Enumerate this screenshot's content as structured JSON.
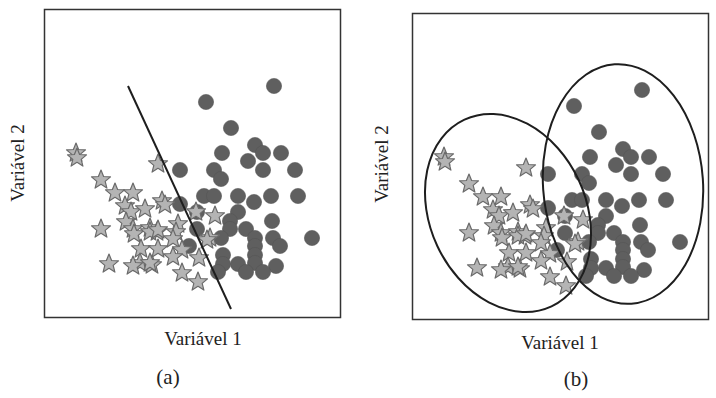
{
  "panels": [
    {
      "id": "a",
      "label": "(a)",
      "xlabel": "Variável 1",
      "ylabel": "Variável 2",
      "boundary": "linear-separator",
      "line": {
        "x1": 128,
        "y1": 86,
        "x2": 231,
        "y2": 309
      }
    },
    {
      "id": "b",
      "label": "(b)",
      "xlabel": "Variável 1",
      "ylabel": "Variável 2",
      "boundary": "ellipses",
      "ellipses": [
        {
          "cx": 508,
          "cy": 213,
          "rx": 78,
          "ry": 103,
          "rot": -25
        },
        {
          "cx": 623,
          "cy": 184,
          "rx": 80,
          "ry": 121,
          "rot": -4
        }
      ]
    }
  ],
  "colors": {
    "star_fill": "#b4b4b4",
    "star_stroke": "#6a6a6a",
    "circle_fill": "#5f5f5f",
    "line": "#1e1e1e",
    "frame": "#333333"
  },
  "chart_data": {
    "type": "scatter",
    "title": "",
    "xlabel": "Variável 1",
    "ylabel": "Variável 2",
    "series": [
      {
        "name": "stars",
        "marker": "star",
        "points_panel_a": [
          [
            76,
            153
          ],
          [
            77,
            158
          ],
          [
            101,
            180
          ],
          [
            115,
            193
          ],
          [
            133,
            193
          ],
          [
            125,
            206
          ],
          [
            131,
            212
          ],
          [
            145,
            209
          ],
          [
            158,
            164
          ],
          [
            162,
            201
          ],
          [
            165,
            205
          ],
          [
            126,
            222
          ],
          [
            133,
            229
          ],
          [
            150,
            228
          ],
          [
            157,
            232
          ],
          [
            178,
            224
          ],
          [
            101,
            229
          ],
          [
            134,
            234
          ],
          [
            150,
            232
          ],
          [
            158,
            230
          ],
          [
            176,
            232
          ],
          [
            196,
            212
          ],
          [
            210,
            238
          ],
          [
            141,
            249
          ],
          [
            158,
            249
          ],
          [
            173,
            239
          ],
          [
            182,
            250
          ],
          [
            140,
            263
          ],
          [
            152,
            265
          ],
          [
            173,
            257
          ],
          [
            182,
            273
          ],
          [
            198,
            282
          ],
          [
            109,
            264
          ],
          [
            133,
            266
          ],
          [
            150,
            263
          ],
          [
            199,
            258
          ],
          [
            215,
            216
          ],
          [
            207,
            240
          ]
        ]
      },
      {
        "name": "circles",
        "marker": "circle",
        "points_panel_a": [
          [
            274,
            86
          ],
          [
            206,
            102
          ],
          [
            231,
            128
          ],
          [
            255,
            145
          ],
          [
            263,
            153
          ],
          [
            281,
            153
          ],
          [
            222,
            153
          ],
          [
            248,
            161
          ],
          [
            180,
            170
          ],
          [
            214,
            170
          ],
          [
            221,
            179
          ],
          [
            263,
            170
          ],
          [
            295,
            170
          ],
          [
            204,
            196
          ],
          [
            214,
            196
          ],
          [
            238,
            196
          ],
          [
            271,
            196
          ],
          [
            298,
            196
          ],
          [
            254,
            202
          ],
          [
            180,
            204
          ],
          [
            197,
            212
          ],
          [
            238,
            212
          ],
          [
            230,
            221
          ],
          [
            272,
            221
          ],
          [
            197,
            229
          ],
          [
            230,
            229
          ],
          [
            221,
            238
          ],
          [
            246,
            229
          ],
          [
            255,
            238
          ],
          [
            273,
            238
          ],
          [
            312,
            238
          ],
          [
            189,
            246
          ],
          [
            223,
            255
          ],
          [
            255,
            246
          ],
          [
            280,
            246
          ],
          [
            223,
            264
          ],
          [
            255,
            255
          ],
          [
            255,
            263
          ],
          [
            238,
            264
          ],
          [
            276,
            266
          ],
          [
            218,
            272
          ],
          [
            246,
            272
          ],
          [
            263,
            272
          ]
        ]
      }
    ],
    "axis_ticks": "none",
    "grid": false,
    "legend": "none"
  }
}
